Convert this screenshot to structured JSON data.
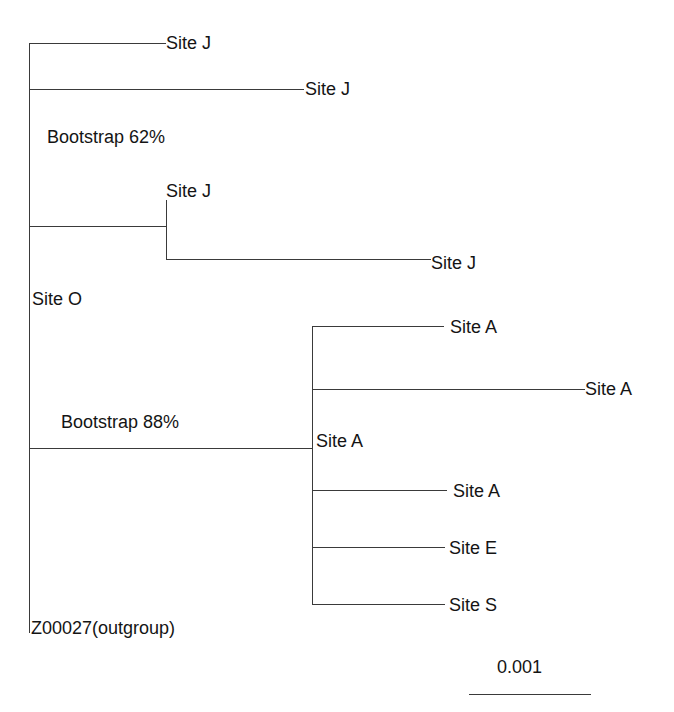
{
  "tree": {
    "leaves": [
      {
        "label": "Site J"
      },
      {
        "label": "Site J"
      },
      {
        "label": "Site J"
      },
      {
        "label": "Site J"
      },
      {
        "label": "Site A"
      },
      {
        "label": "Site A"
      },
      {
        "label": "Site A"
      },
      {
        "label": "Site E"
      },
      {
        "label": "Site S"
      },
      {
        "label": "Z00027(outgroup)"
      }
    ],
    "node_labels": {
      "bootstrap_j": "Bootstrap 62%",
      "bootstrap_a": "Bootstrap 88%",
      "node_site_o": "Site O",
      "node_site_a": "Site A"
    },
    "scale_bar": {
      "label": "0.001"
    }
  }
}
